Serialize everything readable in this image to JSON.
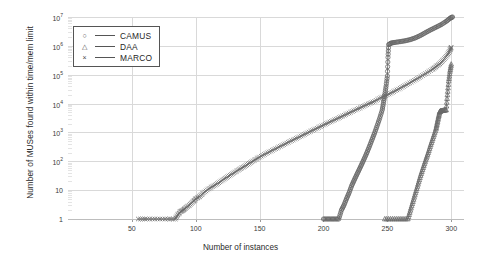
{
  "chart_data": {
    "type": "line",
    "title": "",
    "xlabel": "Number of instances",
    "ylabel": "Number of MUSes found within time/mem limit",
    "xlim": [
      0,
      310
    ],
    "ylim_log10": [
      0,
      7
    ],
    "yscale": "log",
    "grid": true,
    "legend_position": "top-left",
    "xticks": [
      50,
      100,
      150,
      200,
      250,
      300
    ],
    "xtick_labels": [
      "50",
      "100",
      "150",
      "200",
      "250",
      "300"
    ],
    "yticks_log10": [
      0,
      1,
      2,
      3,
      4,
      5,
      6,
      7
    ],
    "ytick_labels": [
      "1",
      "10",
      "10^2",
      "10^3",
      "10^4",
      "10^5",
      "10^6",
      "10^7"
    ],
    "ytick_bases": [
      "1",
      "10",
      "10",
      "10",
      "10",
      "10",
      "10",
      "10"
    ],
    "ytick_exponents": [
      "",
      "",
      "2",
      "3",
      "4",
      "5",
      "6",
      "7"
    ],
    "series": [
      {
        "name": "CAMUS",
        "marker": "circle",
        "marker_glyph": "○",
        "color": "#666666",
        "points": [
          [
            200,
            1
          ],
          [
            204,
            1
          ],
          [
            208,
            1
          ],
          [
            212,
            1
          ],
          [
            214,
            2
          ],
          [
            216,
            3
          ],
          [
            218,
            5
          ],
          [
            220,
            8
          ],
          [
            222,
            14
          ],
          [
            224,
            22
          ],
          [
            226,
            34
          ],
          [
            228,
            52
          ],
          [
            230,
            80
          ],
          [
            232,
            125
          ],
          [
            234,
            200
          ],
          [
            236,
            330
          ],
          [
            238,
            560
          ],
          [
            240,
            950
          ],
          [
            242,
            1700
          ],
          [
            244,
            3100
          ],
          [
            246,
            6000
          ],
          [
            247,
            11000
          ],
          [
            248,
            20000
          ],
          [
            249,
            40000
          ],
          [
            250,
            90000
          ],
          [
            250.5,
            400000
          ],
          [
            251,
            1100000
          ],
          [
            253,
            1250000
          ],
          [
            256,
            1320000
          ],
          [
            260,
            1400000
          ],
          [
            264,
            1500000
          ],
          [
            268,
            1650000
          ],
          [
            272,
            1900000
          ],
          [
            276,
            2300000
          ],
          [
            280,
            2900000
          ],
          [
            284,
            3600000
          ],
          [
            288,
            4400000
          ],
          [
            292,
            5400000
          ],
          [
            296,
            7000000
          ],
          [
            299,
            9000000
          ],
          [
            301,
            10000000
          ]
        ]
      },
      {
        "name": "DAA",
        "marker": "triangle",
        "marker_glyph": "△",
        "color": "#6a6a6a",
        "points": [
          [
            248,
            1
          ],
          [
            254,
            1
          ],
          [
            260,
            1
          ],
          [
            266,
            1
          ],
          [
            268,
            2
          ],
          [
            270,
            4
          ],
          [
            272,
            8
          ],
          [
            274,
            16
          ],
          [
            276,
            32
          ],
          [
            278,
            60
          ],
          [
            280,
            110
          ],
          [
            282,
            200
          ],
          [
            284,
            380
          ],
          [
            286,
            700
          ],
          [
            288,
            1300
          ],
          [
            289,
            2100
          ],
          [
            290,
            3400
          ],
          [
            291,
            5200
          ],
          [
            292,
            5600
          ],
          [
            294,
            5800
          ],
          [
            296,
            6000
          ],
          [
            297,
            20000
          ],
          [
            298,
            60000
          ],
          [
            299,
            130000
          ],
          [
            300,
            230000
          ]
        ]
      },
      {
        "name": "MARCO",
        "marker": "x",
        "marker_glyph": "×",
        "color": "#6b6b6b",
        "points": [
          [
            55,
            1
          ],
          [
            62,
            1
          ],
          [
            70,
            1
          ],
          [
            78,
            1
          ],
          [
            84,
            1
          ],
          [
            86,
            1.4
          ],
          [
            88,
            1.8
          ],
          [
            90,
            2
          ],
          [
            92,
            2.4
          ],
          [
            95,
            3
          ],
          [
            98,
            4
          ],
          [
            100,
            5
          ],
          [
            103,
            6
          ],
          [
            106,
            8
          ],
          [
            110,
            11
          ],
          [
            114,
            14
          ],
          [
            118,
            18
          ],
          [
            122,
            24
          ],
          [
            126,
            31
          ],
          [
            130,
            40
          ],
          [
            134,
            52
          ],
          [
            138,
            66
          ],
          [
            142,
            85
          ],
          [
            146,
            110
          ],
          [
            150,
            140
          ],
          [
            155,
            185
          ],
          [
            160,
            240
          ],
          [
            165,
            310
          ],
          [
            170,
            400
          ],
          [
            175,
            520
          ],
          [
            180,
            660
          ],
          [
            185,
            850
          ],
          [
            190,
            1100
          ],
          [
            195,
            1400
          ],
          [
            200,
            1800
          ],
          [
            205,
            2300
          ],
          [
            210,
            2900
          ],
          [
            215,
            3700
          ],
          [
            220,
            4700
          ],
          [
            225,
            6000
          ],
          [
            230,
            7600
          ],
          [
            235,
            9700
          ],
          [
            240,
            12000
          ],
          [
            245,
            16000
          ],
          [
            250,
            20000
          ],
          [
            255,
            26000
          ],
          [
            260,
            34000
          ],
          [
            265,
            45000
          ],
          [
            270,
            60000
          ],
          [
            275,
            80000
          ],
          [
            280,
            110000
          ],
          [
            285,
            150000
          ],
          [
            288,
            190000
          ],
          [
            291,
            240000
          ],
          [
            294,
            330000
          ],
          [
            297,
            480000
          ],
          [
            299,
            700000
          ],
          [
            300,
            900000
          ]
        ]
      }
    ]
  },
  "legend": {
    "items": [
      {
        "label": "CAMUS",
        "marker": "○"
      },
      {
        "label": "DAA",
        "marker": "△"
      },
      {
        "label": "MARCO",
        "marker": "×"
      }
    ]
  }
}
